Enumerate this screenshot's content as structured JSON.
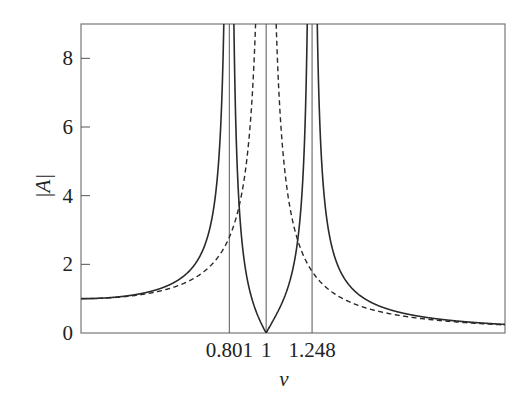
{
  "chart_data": {
    "type": "line",
    "title": "",
    "xlabel": "ν",
    "ylabel": "|A|",
    "xlim": [
      0,
      2.29
    ],
    "ylim": [
      0,
      9
    ],
    "grid": false,
    "legend": null,
    "xticks": [
      {
        "value": 0.801,
        "label": "0.801"
      },
      {
        "value": 1,
        "label": "1"
      },
      {
        "value": 1.248,
        "label": "1.248"
      }
    ],
    "yticks": [
      {
        "value": 0,
        "label": "0"
      },
      {
        "value": 2,
        "label": "2"
      },
      {
        "value": 4,
        "label": "4"
      },
      {
        "value": 6,
        "label": "6"
      },
      {
        "value": 8,
        "label": "8"
      }
    ],
    "vertical_lines": [
      0.801,
      1,
      1.248
    ],
    "series": [
      {
        "name": "two-degree-of-freedom response",
        "style": "solid",
        "formula": "|1-ν²| / |(1-ν²/0.801²)(1-ν²/1.248²)|",
        "resonances": [
          0.801,
          1.248
        ],
        "antiresonance": 1,
        "x": [
          0,
          0.2,
          0.4,
          0.6,
          0.7,
          0.75,
          0.78,
          0.82,
          0.85,
          0.9,
          0.95,
          1.0,
          1.05,
          1.1,
          1.15,
          1.2,
          1.23,
          1.27,
          1.3,
          1.4,
          1.6,
          1.8,
          2.0,
          2.29
        ],
        "y": [
          1.0,
          1.01,
          1.07,
          1.35,
          1.86,
          2.52,
          3.44,
          4.13,
          2.8,
          1.45,
          0.64,
          0.0,
          0.74,
          1.65,
          3.05,
          5.85,
          13.8,
          13.0,
          6.6,
          2.15,
          0.92,
          0.56,
          0.39,
          0.27
        ]
      },
      {
        "name": "single-degree-of-freedom response",
        "style": "dashed",
        "formula": "1 / |1-ν²|",
        "x": [
          0,
          0.2,
          0.4,
          0.6,
          0.8,
          0.9,
          0.95,
          1.05,
          1.1,
          1.2,
          1.4,
          1.6,
          1.8,
          2.0,
          2.29
        ],
        "y": [
          1.0,
          1.04,
          1.19,
          1.56,
          2.78,
          5.26,
          10.3,
          9.76,
          4.76,
          2.27,
          1.04,
          0.64,
          0.45,
          0.33,
          0.24
        ]
      }
    ]
  }
}
